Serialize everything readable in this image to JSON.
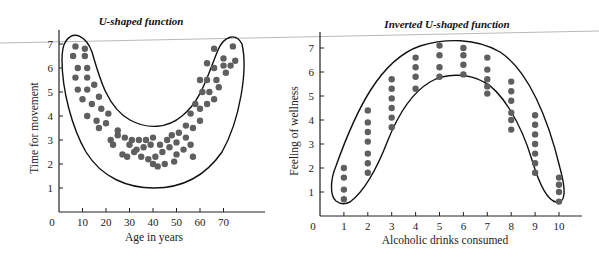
{
  "chart_data": [
    {
      "type": "scatter",
      "title": "U-shaped function",
      "xlabel": "Age in years",
      "ylabel": "Time for movement",
      "x_ticks": [
        0,
        10,
        20,
        30,
        40,
        50,
        60,
        70
      ],
      "y_ticks": [
        1,
        2,
        3,
        4,
        5,
        6,
        7
      ],
      "xlim": [
        0,
        80
      ],
      "ylim": [
        0,
        7.5
      ],
      "grid": false,
      "legend": null,
      "annotation": "Dots enclosed by a U-shaped outline; time for movement is high at young and old ages, lowest around age 40",
      "points": [
        [
          7,
          6.9
        ],
        [
          11,
          6.8
        ],
        [
          6,
          6.5
        ],
        [
          11,
          6.5
        ],
        [
          8,
          6.0
        ],
        [
          12,
          6.0
        ],
        [
          7,
          5.6
        ],
        [
          12,
          5.6
        ],
        [
          8,
          5.1
        ],
        [
          12,
          5.1
        ],
        [
          15,
          5.3
        ],
        [
          10,
          4.7
        ],
        [
          14,
          4.5
        ],
        [
          17,
          4.8
        ],
        [
          18,
          4.3
        ],
        [
          21,
          4.1
        ],
        [
          12,
          4.0
        ],
        [
          16,
          3.8
        ],
        [
          20,
          3.7
        ],
        [
          17,
          3.5
        ],
        [
          25,
          3.4
        ],
        [
          22,
          3.0
        ],
        [
          25,
          3.2
        ],
        [
          28,
          3.1
        ],
        [
          31,
          3.0
        ],
        [
          34,
          3.0
        ],
        [
          37,
          3.0
        ],
        [
          40,
          3.1
        ],
        [
          23,
          2.8
        ],
        [
          30,
          2.8
        ],
        [
          33,
          2.6
        ],
        [
          36,
          2.7
        ],
        [
          39,
          2.8
        ],
        [
          43,
          2.8
        ],
        [
          46,
          3.0
        ],
        [
          27,
          2.4
        ],
        [
          32,
          2.5
        ],
        [
          29,
          2.3
        ],
        [
          35,
          2.3
        ],
        [
          38,
          2.2
        ],
        [
          41,
          2.3
        ],
        [
          44,
          2.5
        ],
        [
          47,
          2.7
        ],
        [
          50,
          2.9
        ],
        [
          40,
          2.0
        ],
        [
          42,
          1.9
        ],
        [
          45,
          2.0
        ],
        [
          49,
          2.1
        ],
        [
          48,
          3.2
        ],
        [
          51,
          3.3
        ],
        [
          54,
          3.1
        ],
        [
          53,
          2.6
        ],
        [
          56,
          2.8
        ],
        [
          57,
          2.3
        ],
        [
          50,
          2.4
        ],
        [
          54,
          3.6
        ],
        [
          57,
          3.5
        ],
        [
          60,
          3.8
        ],
        [
          56,
          4.1
        ],
        [
          60,
          4.3
        ],
        [
          63,
          4.5
        ],
        [
          58,
          4.5
        ],
        [
          61,
          5.0
        ],
        [
          64,
          5.0
        ],
        [
          66,
          4.7
        ],
        [
          60,
          5.5
        ],
        [
          63,
          5.5
        ],
        [
          67,
          5.5
        ],
        [
          63,
          6.2
        ],
        [
          66,
          6.0
        ],
        [
          70,
          6.1
        ],
        [
          66,
          6.8
        ],
        [
          70,
          6.4
        ],
        [
          74,
          6.9
        ],
        [
          73,
          6.1
        ],
        [
          75,
          6.3
        ],
        [
          71,
          5.8
        ],
        [
          68,
          5.2
        ]
      ]
    },
    {
      "type": "scatter",
      "title": "Inverted U-shaped function",
      "xlabel": "Alcoholic drinks consumed",
      "ylabel": "Feeling of wellness",
      "x_ticks": [
        0,
        1,
        2,
        3,
        4,
        5,
        6,
        7,
        8,
        9,
        10
      ],
      "y_ticks": [
        1,
        2,
        3,
        4,
        5,
        6,
        7
      ],
      "xlim": [
        0,
        10.6
      ],
      "ylim": [
        0,
        7.5
      ],
      "grid": false,
      "legend": null,
      "annotation": "Dots enclosed by an inverted-U outline; wellness peaks around 5-6 drinks",
      "columns": [
        {
          "x": 1,
          "y": [
            2.0,
            1.6,
            1.1,
            0.7
          ]
        },
        {
          "x": 2,
          "y": [
            4.4,
            3.9,
            3.5,
            3.1,
            2.6,
            2.2,
            1.8
          ]
        },
        {
          "x": 3,
          "y": [
            5.7,
            5.3,
            4.9,
            4.5,
            4.1,
            3.7
          ]
        },
        {
          "x": 4,
          "y": [
            6.6,
            6.2,
            5.8,
            5.3
          ]
        },
        {
          "x": 5,
          "y": [
            7.1,
            6.7,
            6.2,
            5.8
          ]
        },
        {
          "x": 6,
          "y": [
            7.0,
            6.7,
            6.3,
            5.9
          ]
        },
        {
          "x": 7,
          "y": [
            6.6,
            6.1,
            5.7,
            5.4,
            5.1
          ]
        },
        {
          "x": 8,
          "y": [
            5.6,
            5.2,
            4.8,
            4.3,
            4.0,
            3.6
          ]
        },
        {
          "x": 9,
          "y": [
            4.2,
            3.8,
            3.4,
            3.0,
            2.6,
            2.2,
            1.8
          ]
        },
        {
          "x": 10,
          "y": [
            1.6,
            1.3,
            1.0,
            0.6
          ]
        }
      ]
    }
  ],
  "dot_color": "#5f5f5f",
  "outline_color": "#111111"
}
